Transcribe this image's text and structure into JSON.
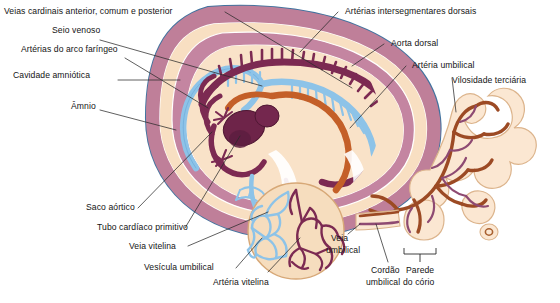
{
  "figure": {
    "background_color": "#ffffff",
    "palette": {
      "chorion_outer_line": "#4a7fae",
      "chorion_band": "#bf7f99",
      "amnion_band": "#c485a1",
      "extraembryonic_coelom": "#f7dcbd",
      "embryo_body": "#f9e2c8",
      "artery_dark": "#7c2a52",
      "vein_blue": "#8dc3e8",
      "umbilical_artery_orange": "#c45f28",
      "villus_vessel_brown": "#9c4a24",
      "villus_capillary_purple": "#8e4a72",
      "yolk_sac_fill": "#f6ddbe",
      "leader_line": "#2b2b2b"
    }
  },
  "labels": {
    "cardinal_veins": "Veias cardinais anterior, comum e posterior",
    "sinus_venosus": "Seio venoso",
    "pharyngeal_arch_arteries": "Artérias do arco faríngeo",
    "amniotic_cavity": "Cavidade amniótica",
    "amnion": "Âmnio",
    "aortic_sac": "Saco aórtico",
    "primitive_heart_tube": "Tubo cardíaco primitivo",
    "vitelline_vein": "Veia vitelina",
    "umbilical_vesicle": "Vesícula umbilical",
    "vitelline_artery": "Artéria vitelina",
    "dorsal_intersegmental_arteries": "Artérias intersegmentares dorsais",
    "dorsal_aorta": "Aorta dorsal",
    "umbilical_artery": "Artéria umbilical",
    "tertiary_villus": "Vilosidade terciária",
    "umbilical_vein_line1": "Veia",
    "umbilical_vein_line2": "umbilical",
    "umbilical_cord_line1": "Cordão",
    "umbilical_cord_line2": "umbilical",
    "chorion_wall_line1": "Parede",
    "chorion_wall_line2": "do cório"
  }
}
